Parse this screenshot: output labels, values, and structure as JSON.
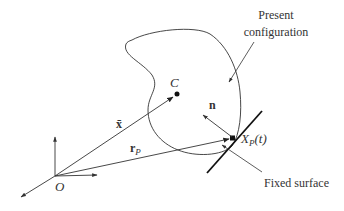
{
  "diagram": {
    "labels": {
      "present_config_line1": "Present",
      "present_config_line2": "configuration",
      "centroid": "C",
      "position_vector_centroid": "x̄",
      "position_vector_point": "r",
      "position_vector_point_sub": "P",
      "normal": "n",
      "contact_point": "X",
      "contact_point_sub": "P",
      "contact_point_arg": "(t)",
      "fixed_surface": "Fixed surface",
      "origin": "O"
    },
    "colors": {
      "stroke": "#333333",
      "background": "#ffffff"
    }
  }
}
